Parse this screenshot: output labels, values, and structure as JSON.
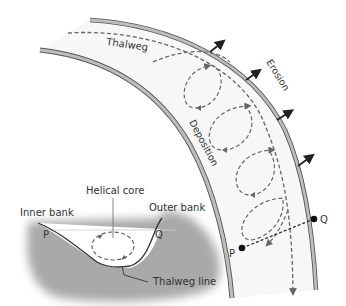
{
  "diagram": {
    "type": "river-meander-helicoidal-flow",
    "colors": {
      "bank_fill": "#bdbdbd",
      "bank_stroke": "#555555",
      "channel_fill": "#f7f7f7",
      "dash": "#666666",
      "arrow": "#222222",
      "cross_section_fill": "#a9a9a9"
    },
    "plan_view": {
      "labels": {
        "thalweg": "Thalweg",
        "erosion": "Erosion",
        "deposition": "Deposition",
        "point_p": "P",
        "point_q": "Q"
      },
      "erosion_arrow_count": 4,
      "helical_loop_count": 4
    },
    "cross_section": {
      "labels": {
        "helical_core": "Helical core",
        "inner_bank": "Inner bank",
        "outer_bank": "Outer bank",
        "thalweg_line": "Thalweg line",
        "point_p": "P",
        "point_q": "Q"
      }
    }
  }
}
